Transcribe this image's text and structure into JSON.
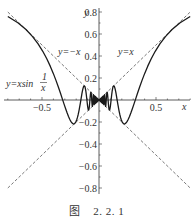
{
  "chart_data": {
    "type": "line",
    "title": "",
    "xlabel": "x",
    "ylabel": "y",
    "xlim": [
      -0.8,
      0.8
    ],
    "ylim": [
      -0.85,
      0.85
    ],
    "grid": false,
    "legend": "none",
    "x_ticks": [
      -0.5,
      0.5
    ],
    "x_tick_labels": [
      "-0.5",
      "0.5"
    ],
    "y_ticks": [
      0.8,
      0.6,
      0.4,
      0.2,
      -0.2,
      -0.4,
      -0.6,
      -0.8
    ],
    "y_tick_labels": [
      "0.8",
      "0.6",
      "0.4",
      "0.2",
      "-0.2",
      "-0.4",
      "-0.6",
      "-0.8"
    ],
    "series": [
      {
        "name": "y=xsin(1/x)",
        "function": "x*sin(1/x)",
        "style": "solid",
        "color": "#222222",
        "domain": [
          -0.8,
          0.8
        ]
      },
      {
        "name": "y=x",
        "function": "x",
        "style": "dashed",
        "color": "#555555",
        "domain": [
          -0.8,
          0.8
        ]
      },
      {
        "name": "y=-x",
        "function": "-x",
        "style": "dashed",
        "color": "#555555",
        "domain": [
          -0.8,
          0.8
        ]
      }
    ],
    "annotations": [
      {
        "text": "y=-x",
        "x": -0.22,
        "y": 0.4
      },
      {
        "text": "y=x",
        "x": 0.35,
        "y": 0.4
      },
      {
        "text": "y=xsin 1/x",
        "x": -0.7,
        "y": 0.15
      }
    ]
  },
  "labels": {
    "y_axis": "y",
    "x_axis": "x",
    "line_pos": "y=x",
    "line_neg": "y=−x",
    "curve_prefix": "y=xsin",
    "curve_frac_num": "1",
    "curve_frac_den": "x"
  },
  "caption": "图    2. 2. 1"
}
